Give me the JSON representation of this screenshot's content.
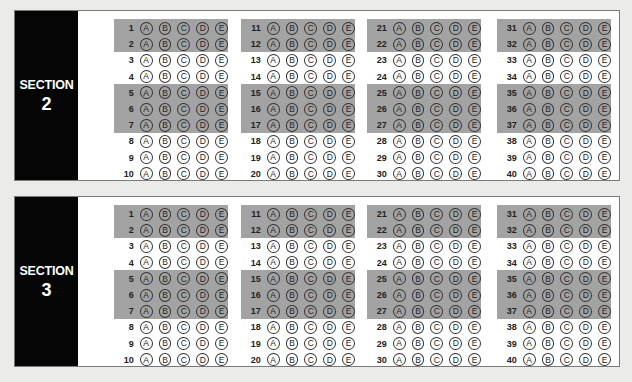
{
  "sections": [
    {
      "label": "SECTION",
      "number": "2",
      "columns": [
        {
          "questions": [
            "1",
            "2",
            "3",
            "4",
            "5",
            "6",
            "7",
            "8",
            "9",
            "10"
          ]
        },
        {
          "questions": [
            "11",
            "12",
            "13",
            "14",
            "15",
            "16",
            "17",
            "18",
            "19",
            "20"
          ]
        },
        {
          "questions": [
            "21",
            "22",
            "23",
            "24",
            "25",
            "26",
            "27",
            "28",
            "29",
            "30"
          ]
        },
        {
          "questions": [
            "31",
            "32",
            "33",
            "34",
            "35",
            "36",
            "37",
            "38",
            "39",
            "40"
          ]
        }
      ]
    },
    {
      "label": "SECTION",
      "number": "3",
      "columns": [
        {
          "questions": [
            "1",
            "2",
            "3",
            "4",
            "5",
            "6",
            "7",
            "8",
            "9",
            "10"
          ]
        },
        {
          "questions": [
            "11",
            "12",
            "13",
            "14",
            "15",
            "16",
            "17",
            "18",
            "19",
            "20"
          ]
        },
        {
          "questions": [
            "21",
            "22",
            "23",
            "24",
            "25",
            "26",
            "27",
            "28",
            "29",
            "30"
          ]
        },
        {
          "questions": [
            "31",
            "32",
            "33",
            "34",
            "35",
            "36",
            "37",
            "38",
            "39",
            "40"
          ]
        }
      ]
    }
  ],
  "choices": [
    "A",
    "B",
    "C",
    "D",
    "E"
  ],
  "shaded_rows": [
    [
      0,
      1
    ],
    [
      4,
      6
    ]
  ],
  "colors": {
    "sidebar": "#050505",
    "band": "#a3a3a3",
    "background": "#ebebea"
  }
}
